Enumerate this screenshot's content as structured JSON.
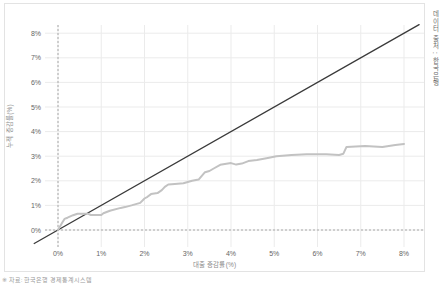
{
  "colors": {
    "background": "#ffffff",
    "box_border": "#e3e3e3",
    "grid": "#ebebeb",
    "dashed_reference": "#a8a8a8",
    "diagonal_line": "#3a3a3a",
    "curve_line": "#c2c2c2",
    "tick_text": "#666666",
    "axis_label_text": "#8a8a8a"
  },
  "labels": {
    "x_axis": "대출 증감률(%)",
    "y_axis": "누적 증감률(%)",
    "source_vertical": "데이터 출처 : 한국은행",
    "footnote": "※ 자료: 한국은행 경제통계시스템"
  },
  "chart_data": {
    "type": "line",
    "title": "",
    "xlabel": "대출 증감률(%)",
    "ylabel": "누적 증감률(%)",
    "xlim": [
      0,
      8
    ],
    "ylim": [
      0,
      8
    ],
    "x_ticks": [
      {
        "v": 0,
        "label": "0%"
      },
      {
        "v": 1,
        "label": "1%"
      },
      {
        "v": 2,
        "label": "2%"
      },
      {
        "v": 3,
        "label": "3%"
      },
      {
        "v": 4,
        "label": "4%"
      },
      {
        "v": 5,
        "label": "5%"
      },
      {
        "v": 6,
        "label": "6%"
      },
      {
        "v": 7,
        "label": "7%"
      },
      {
        "v": 8,
        "label": "8%"
      }
    ],
    "y_ticks": [
      {
        "v": 0,
        "label": "0%"
      },
      {
        "v": 1,
        "label": "1%"
      },
      {
        "v": 2,
        "label": "2%"
      },
      {
        "v": 3,
        "label": "3%"
      },
      {
        "v": 4,
        "label": "4%"
      },
      {
        "v": 5,
        "label": "5%"
      },
      {
        "v": 6,
        "label": "6%"
      },
      {
        "v": 7,
        "label": "7%"
      },
      {
        "v": 8,
        "label": "8%"
      }
    ],
    "grid": true,
    "legend": "none",
    "reference_lines": {
      "dashed_horizontal_at_y": 0,
      "dashed_vertical_at_x": 0
    },
    "series": [
      {
        "name": "diagonal-reference",
        "style": "solid",
        "color_key": "diagonal_line",
        "width": 1.3,
        "points": [
          [
            -0.55,
            -0.55
          ],
          [
            8.35,
            8.35
          ]
        ]
      },
      {
        "name": "cumulative-curve",
        "style": "solid",
        "color_key": "curve_line",
        "width": 2,
        "points": [
          [
            0,
            0
          ],
          [
            0.1,
            0.3
          ],
          [
            0.15,
            0.45
          ],
          [
            0.22,
            0.5
          ],
          [
            0.35,
            0.6
          ],
          [
            0.45,
            0.66
          ],
          [
            0.7,
            0.66
          ],
          [
            0.76,
            0.61
          ],
          [
            1.0,
            0.61
          ],
          [
            1.05,
            0.68
          ],
          [
            1.2,
            0.78
          ],
          [
            1.45,
            0.9
          ],
          [
            1.55,
            0.93
          ],
          [
            1.7,
            1.0
          ],
          [
            1.9,
            1.1
          ],
          [
            2.0,
            1.28
          ],
          [
            2.07,
            1.35
          ],
          [
            2.15,
            1.46
          ],
          [
            2.3,
            1.5
          ],
          [
            2.4,
            1.62
          ],
          [
            2.47,
            1.75
          ],
          [
            2.55,
            1.85
          ],
          [
            2.7,
            1.87
          ],
          [
            2.9,
            1.9
          ],
          [
            3.1,
            2.0
          ],
          [
            3.25,
            2.05
          ],
          [
            3.4,
            2.35
          ],
          [
            3.5,
            2.4
          ],
          [
            3.6,
            2.5
          ],
          [
            3.75,
            2.65
          ],
          [
            4.0,
            2.72
          ],
          [
            4.12,
            2.66
          ],
          [
            4.25,
            2.7
          ],
          [
            4.4,
            2.8
          ],
          [
            4.6,
            2.85
          ],
          [
            4.85,
            2.93
          ],
          [
            5.05,
            3.0
          ],
          [
            5.4,
            3.05
          ],
          [
            5.75,
            3.08
          ],
          [
            6.2,
            3.08
          ],
          [
            6.5,
            3.05
          ],
          [
            6.6,
            3.1
          ],
          [
            6.67,
            3.38
          ],
          [
            7.1,
            3.42
          ],
          [
            7.3,
            3.4
          ],
          [
            7.5,
            3.38
          ],
          [
            7.8,
            3.45
          ],
          [
            8.0,
            3.5
          ]
        ]
      }
    ],
    "layout": {
      "box_w": 421,
      "box_h": 269,
      "x0_px": 53,
      "px_per_x": 43.25,
      "y0_px": 226,
      "px_per_y": 24.6,
      "grid_x_from": 40,
      "grid_x_to": 419,
      "grid_y_from": 21,
      "grid_y_to": 243,
      "x_tick_label_y": 252
    }
  }
}
